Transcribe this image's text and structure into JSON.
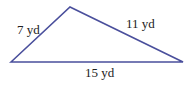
{
  "diagram": {
    "type": "triangle",
    "stroke_color": "#4a4f9c",
    "vertices": {
      "left": [
        11,
        62
      ],
      "top": [
        70,
        7
      ],
      "right": [
        183,
        62
      ]
    },
    "sides": [
      {
        "id": "left-side",
        "label": "7 yd"
      },
      {
        "id": "right-side",
        "label": "11 yd"
      },
      {
        "id": "base",
        "label": "15 yd"
      }
    ]
  }
}
